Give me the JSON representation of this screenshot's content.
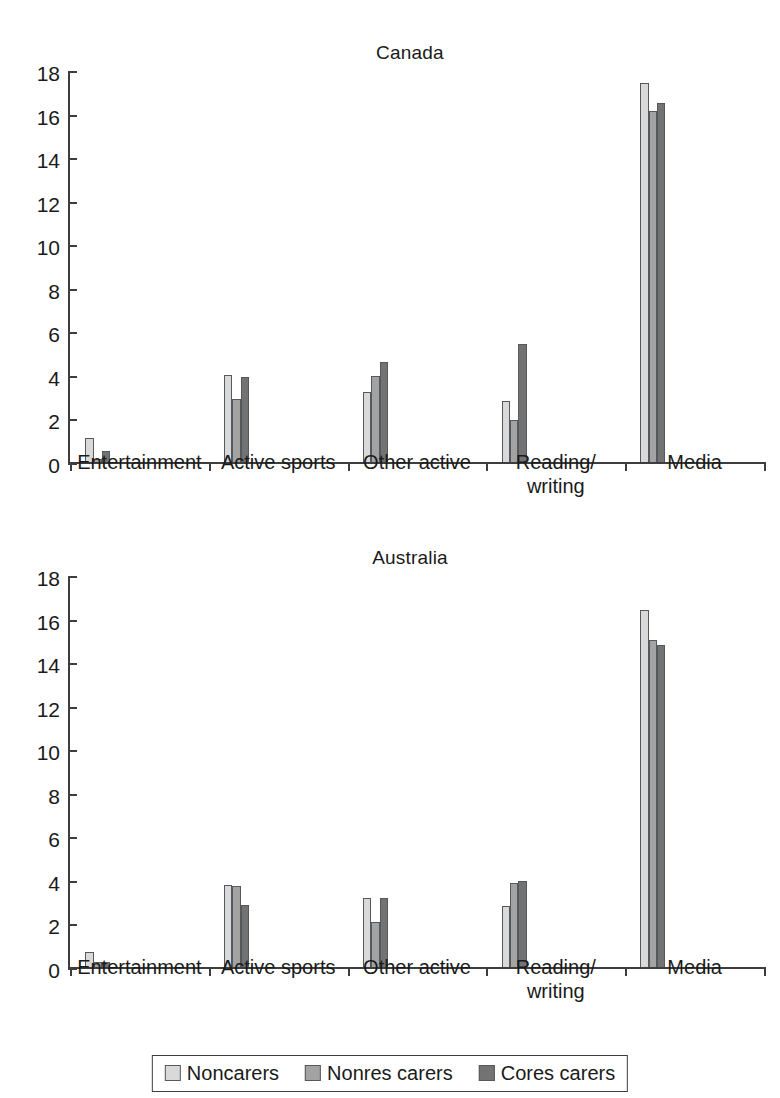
{
  "figure": {
    "legend": {
      "entries": [
        {
          "label": "Noncarers",
          "color": "#d9d9d9"
        },
        {
          "label": "Nonres carers",
          "color": "#a3a3a3"
        },
        {
          "label": "Cores carers",
          "color": "#737373"
        }
      ]
    }
  },
  "chart_data": [
    {
      "type": "bar",
      "title": "Canada",
      "xlabel": "",
      "ylabel": "",
      "ylim": [
        0,
        18
      ],
      "yticks": [
        0,
        2,
        4,
        6,
        8,
        10,
        12,
        14,
        16,
        18
      ],
      "ytick_labels": [
        "0",
        "2",
        "4",
        "6",
        "8",
        "10",
        "12",
        "14",
        "16",
        "18"
      ],
      "grid": false,
      "legend_position": "bottom",
      "categories": [
        "Entertainment",
        "Active sports",
        "Other active",
        "Reading/\nwriting",
        "Media"
      ],
      "series": [
        {
          "name": "Noncarers",
          "color": "#d9d9d9",
          "values": [
            1.2,
            4.1,
            3.3,
            2.9,
            17.5
          ]
        },
        {
          "name": "Nonres carers",
          "color": "#a3a3a3",
          "values": [
            0.25,
            3.0,
            4.05,
            2.0,
            16.2
          ]
        },
        {
          "name": "Cores carers",
          "color": "#737373",
          "values": [
            0.6,
            4.0,
            4.7,
            5.5,
            16.6
          ]
        }
      ]
    },
    {
      "type": "bar",
      "title": "Australia",
      "xlabel": "",
      "ylabel": "",
      "ylim": [
        0,
        18
      ],
      "yticks": [
        0,
        2,
        4,
        6,
        8,
        10,
        12,
        14,
        16,
        18
      ],
      "ytick_labels": [
        "0",
        "2",
        "4",
        "6",
        "8",
        "10",
        "12",
        "14",
        "16",
        "18"
      ],
      "grid": false,
      "legend_position": "bottom",
      "categories": [
        "Entertainment",
        "Active sports",
        "Other active",
        "Reading/\nwriting",
        "Media"
      ],
      "series": [
        {
          "name": "Noncarers",
          "color": "#d9d9d9",
          "values": [
            0.8,
            3.85,
            3.25,
            2.9,
            16.5
          ]
        },
        {
          "name": "Nonres carers",
          "color": "#a3a3a3",
          "values": [
            0.3,
            3.8,
            2.15,
            3.95,
            15.1
          ]
        },
        {
          "name": "Cores carers",
          "color": "#737373",
          "values": [
            0.3,
            2.95,
            3.25,
            4.05,
            14.9
          ]
        }
      ]
    }
  ]
}
